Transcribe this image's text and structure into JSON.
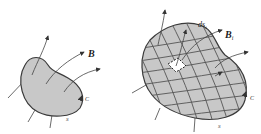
{
  "figure": {
    "left_panel": {
      "field_label": "B",
      "curve_label": "C",
      "surface_label": "S"
    },
    "right_panel": {
      "element_label": "ds",
      "element_subscript": "i",
      "field_label": "B",
      "field_subscript": "i",
      "curve_label": "C",
      "surface_label": "S"
    },
    "colors": {
      "surface_fill": "#c8c8c8",
      "outline": "#3a3a3a",
      "grid": "#555555",
      "background": "#ffffff"
    }
  }
}
